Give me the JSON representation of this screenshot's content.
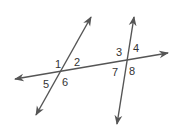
{
  "diagram": {
    "type": "parallel-lines-transversal",
    "stroke_color": "#555555",
    "label_color": "#333333",
    "lines": [
      {
        "id": "horizontal-line",
        "x1": 15,
        "y1": 79,
        "x2": 168,
        "y2": 53
      },
      {
        "id": "left-transversal",
        "x1": 36,
        "y1": 115,
        "x2": 91,
        "y2": 17
      },
      {
        "id": "right-transversal",
        "x1": 117,
        "y1": 124,
        "x2": 134,
        "y2": 17
      }
    ],
    "angle_labels": [
      {
        "text": "1",
        "x": 55,
        "y": 68
      },
      {
        "text": "2",
        "x": 74,
        "y": 66
      },
      {
        "text": "5",
        "x": 43,
        "y": 88
      },
      {
        "text": "6",
        "x": 62,
        "y": 86
      },
      {
        "text": "3",
        "x": 116,
        "y": 56
      },
      {
        "text": "4",
        "x": 133,
        "y": 52
      },
      {
        "text": "7",
        "x": 112,
        "y": 76
      },
      {
        "text": "8",
        "x": 129,
        "y": 75
      }
    ]
  }
}
